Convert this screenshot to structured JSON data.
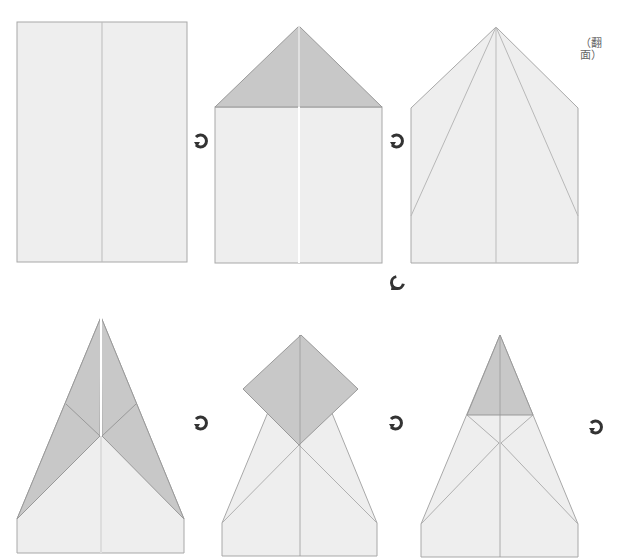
{
  "colors": {
    "background": "#ffffff",
    "paper": "#eeeeee",
    "paper_back": "#c8c8c8",
    "edge": "#a8a8a8",
    "crease": "#b8b8b8",
    "arrow": "#333333"
  },
  "annotation": {
    "flip_over": "（翻面）"
  },
  "steps": [
    {
      "id": 1,
      "label": "Start with rectangle, center crease"
    },
    {
      "id": 2,
      "label": "Fold top corners to center"
    },
    {
      "id": 3,
      "label": "Unfold, crease diagonals"
    },
    {
      "id": 4,
      "label": "Fold sides to center"
    },
    {
      "id": 5,
      "label": "Fold top down / diamond"
    },
    {
      "id": 6,
      "label": "Fold tip triangle"
    }
  ],
  "icons": {
    "step_arrow": "step-arrow-icon",
    "turn_arrow": "turn-arrow-icon"
  }
}
